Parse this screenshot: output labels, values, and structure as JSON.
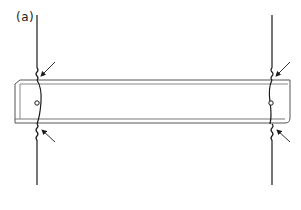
{
  "figure": {
    "panel_label": "(a)",
    "colors": {
      "line": "#1a1a1a",
      "beam_edge": "#555555",
      "background": "#ffffff"
    },
    "elements": {
      "beam": {
        "x": 15,
        "y": 80,
        "width": 275,
        "height": 43
      },
      "left_wire": {
        "x": 37,
        "y_top": 15,
        "y_bottom": 185
      },
      "right_wire": {
        "x": 272,
        "y_top": 15,
        "y_bottom": 185
      },
      "arrows": [
        {
          "position": "left-top",
          "points_to": "upper twist, left wire"
        },
        {
          "position": "left-bottom",
          "points_to": "lower twist, left wire"
        },
        {
          "position": "right-top",
          "points_to": "upper twist, right wire"
        },
        {
          "position": "right-bottom",
          "points_to": "lower twist, right wire"
        }
      ],
      "pins": [
        {
          "position": "left",
          "x": 37,
          "y": 103
        },
        {
          "position": "right",
          "x": 271,
          "y": 103
        }
      ]
    }
  }
}
